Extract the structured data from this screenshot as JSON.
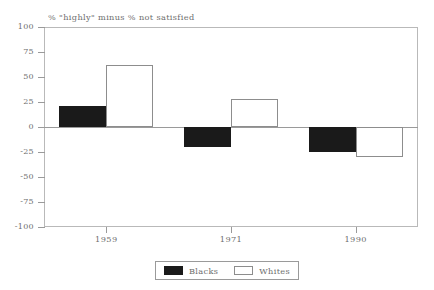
{
  "chart_data": {
    "type": "bar",
    "title": "% \"highly\" minus % not satisfied",
    "xlabel": "",
    "ylabel": "",
    "categories": [
      "1959",
      "1971",
      "1990"
    ],
    "series": [
      {
        "name": "Blacks",
        "values": [
          21,
          -20,
          -25
        ],
        "color": "#1a1a1a",
        "fill": "solid"
      },
      {
        "name": "Whites",
        "values": [
          62,
          28,
          -30
        ],
        "color": "#ffffff",
        "fill": "outline"
      }
    ],
    "ylim": [
      -100,
      100
    ],
    "yticks": [
      100,
      75,
      50,
      25,
      0,
      -25,
      -50,
      -75,
      -100
    ],
    "ytick_labels": [
      "100",
      "75",
      "50",
      "25",
      "0",
      "-25",
      "-50",
      "-75",
      "-100"
    ],
    "grid": false,
    "zero_line": true,
    "legend_position": "bottom-center",
    "legend_entries": [
      "Blacks",
      "Whites"
    ]
  },
  "axis": {
    "y_labels": [
      "100",
      "75",
      "50",
      "25",
      "0",
      "-25",
      "-50",
      "-75",
      "-100"
    ],
    "x_labels": [
      "1959",
      "1971",
      "1990"
    ]
  },
  "legend": {
    "blacks_label": "Blacks",
    "whites_label": "Whites"
  }
}
